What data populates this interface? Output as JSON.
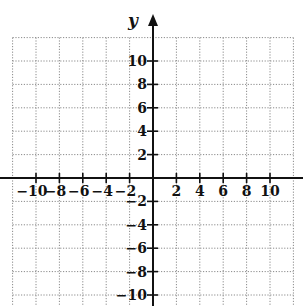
{
  "figure": {
    "type": "coordinate-plane",
    "y_axis_label": "y",
    "x_ticks": [
      "-10",
      "-8",
      "-6",
      "-4",
      "-2",
      "2",
      "4",
      "6",
      "8",
      "10"
    ],
    "y_ticks": [
      "10",
      "8",
      "6",
      "4",
      "2",
      "-2",
      "-4",
      "-6",
      "-8",
      "-10"
    ],
    "grid": "dotted",
    "grid_step": 2,
    "x_range": [
      -12,
      12
    ],
    "y_range": [
      -10,
      12
    ]
  },
  "colors": {
    "axis": "#111111",
    "grid": "#8a8a8a",
    "background": "#ffffff"
  }
}
